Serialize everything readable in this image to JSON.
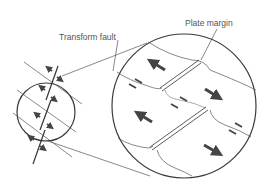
{
  "labels": {
    "transform_fault": "Transform fault",
    "plate_margin": "Plate margin"
  },
  "colors": {
    "line": "#4a4a4a",
    "circle": "#3a3a3a",
    "arrow": "#444444",
    "text": "#555555",
    "background": "#ffffff"
  }
}
